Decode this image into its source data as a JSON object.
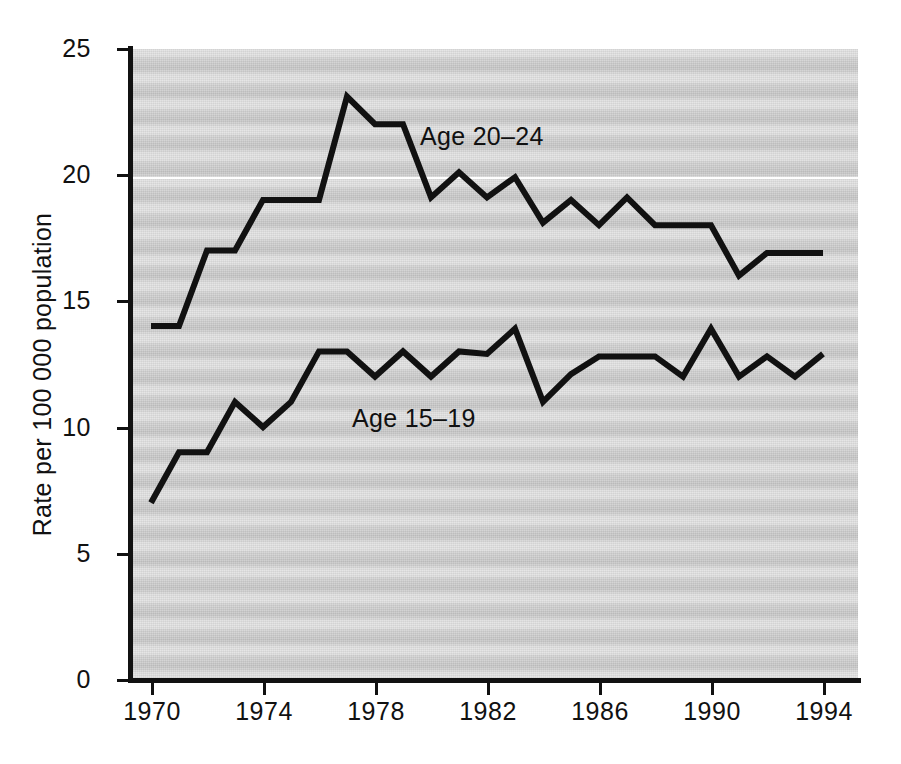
{
  "chart_data": {
    "type": "line",
    "title": "",
    "xlabel": "",
    "ylabel": "Rate per 100 000 population",
    "xlim": [
      1969.4,
      1994.8
    ],
    "ylim": [
      0,
      25
    ],
    "grid": false,
    "legend_position": "inline-annotations",
    "x": [
      1970,
      1971,
      1972,
      1973,
      1974,
      1975,
      1976,
      1977,
      1978,
      1979,
      1980,
      1981,
      1982,
      1983,
      1984,
      1985,
      1986,
      1987,
      1988,
      1989,
      1990,
      1991,
      1992,
      1993,
      1994
    ],
    "xticks": [
      1970,
      1974,
      1978,
      1982,
      1986,
      1990,
      1994
    ],
    "xtick_labels": [
      "1970",
      "1974",
      "1978",
      "1982",
      "1986",
      "1990",
      "1994"
    ],
    "yticks": [
      0,
      5,
      10,
      15,
      20,
      25
    ],
    "ytick_labels": [
      "0",
      "5",
      "10",
      "15",
      "20",
      "25"
    ],
    "series": [
      {
        "name": "Age 20–24",
        "label": "Age 20–24",
        "values": [
          14.0,
          14.0,
          17.0,
          17.0,
          19.0,
          19.0,
          19.0,
          23.1,
          22.0,
          22.0,
          19.1,
          20.1,
          19.1,
          19.9,
          18.1,
          19.0,
          18.0,
          19.1,
          18.0,
          18.0,
          18.0,
          16.0,
          16.9,
          16.9,
          16.9
        ]
      },
      {
        "name": "Age 15–19",
        "label": "Age 15–19",
        "values": [
          7.0,
          9.0,
          9.0,
          11.0,
          10.0,
          11.0,
          13.0,
          13.0,
          12.0,
          13.0,
          12.0,
          13.0,
          12.9,
          13.9,
          11.0,
          12.1,
          12.8,
          12.8,
          12.8,
          12.0,
          13.9,
          12.0,
          12.8,
          12.0,
          12.9
        ]
      }
    ],
    "annotations": [
      {
        "text": "Age 20–24",
        "series": "Age 20–24"
      },
      {
        "text": "Age 15–19",
        "series": "Age 15–19"
      }
    ],
    "colors": {
      "line": "#111111",
      "plot_background": "#d2d2d2",
      "page_background": "#ffffff",
      "axis": "#111111"
    }
  }
}
